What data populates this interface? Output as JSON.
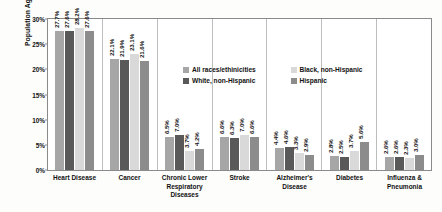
{
  "chart_data": {
    "type": "bar",
    "title": "",
    "xlabel": "",
    "ylabel": "Population Aged 65 or Older",
    "ylim": [
      0,
      30
    ],
    "yticks": [
      "0%",
      "5%",
      "10%",
      "15%",
      "20%",
      "25%",
      "30%"
    ],
    "ytick_values": [
      0,
      5,
      10,
      15,
      20,
      25,
      30
    ],
    "grid": false,
    "legend_position": "inside-upper-right",
    "categories": [
      "Heart Disease",
      "Cancer",
      "Chronic Lower Respiratory Diseases",
      "Stroke",
      "Alzheimer's Disease",
      "Diabetes",
      "Influenza & Pneumonia"
    ],
    "category_lines": [
      [
        "Heart Disease"
      ],
      [
        "Cancer"
      ],
      [
        "Chronic Lower",
        "Respiratory Diseases"
      ],
      [
        "Stroke"
      ],
      [
        "Alzheimer's",
        "Disease"
      ],
      [
        "Diabetes"
      ],
      [
        "Influenza &",
        "Pneumonia"
      ]
    ],
    "series": [
      {
        "name": "All races/ethinicities",
        "color": "#a6a6a6",
        "values": [
          27.7,
          22.1,
          6.5,
          6.6,
          4.4,
          2.8,
          2.6
        ],
        "labels": [
          "27.7%",
          "22.1%",
          "6.5%",
          "6.6%",
          "4.4%",
          "2.8%",
          "2.6%"
        ]
      },
      {
        "name": "White, non-Hispanic",
        "color": "#595959",
        "values": [
          27.6,
          21.9,
          7.0,
          6.3,
          4.6,
          2.5,
          2.6
        ],
        "labels": [
          "27.6%",
          "21.9%",
          "7.0%",
          "6.3%",
          "4.6%",
          "2.5%",
          "2.6%"
        ]
      },
      {
        "name": "Black, non-Hispanic",
        "color": "#d9d9d9",
        "values": [
          28.2,
          23.1,
          3.7,
          7.0,
          3.3,
          3.7,
          2.3
        ],
        "labels": [
          "28.2%",
          "23.1%",
          "3.7%",
          "7.0%",
          "3.3%",
          "3.7%",
          "2.3%"
        ]
      },
      {
        "name": "Hispanic",
        "color": "#8c8c8c",
        "values": [
          27.6,
          21.6,
          4.2,
          6.6,
          2.9,
          5.6,
          3.0
        ],
        "labels": [
          "27.6%",
          "21.6%",
          "4.2%",
          "6.6%",
          "2.9%",
          "5.6%",
          "3.0%"
        ]
      }
    ],
    "legend": [
      {
        "label": "All races/ethinicities",
        "color": "#a6a6a6"
      },
      {
        "label": "Black, non-Hispanic",
        "color": "#d9d9d9"
      },
      {
        "label": "White, non-Hispanic",
        "color": "#595959"
      },
      {
        "label": "Hispanic",
        "color": "#8c8c8c"
      }
    ]
  }
}
